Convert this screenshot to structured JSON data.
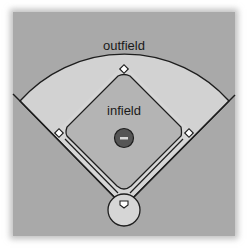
{
  "diagram": {
    "labels": {
      "outfield": "outfield",
      "infield": "infield"
    },
    "colors": {
      "background": "#a9a9a9",
      "outfield_grass": "#d2d2d2",
      "infield_grass": "#b4b4b4",
      "base_path": "#d6d6d6",
      "outline": "#1e1e1e",
      "mound": "#555555",
      "base": "#ffffff"
    },
    "bases": [
      "second-base",
      "first-base",
      "third-base",
      "home-plate"
    ],
    "mound_symbol": "−"
  }
}
